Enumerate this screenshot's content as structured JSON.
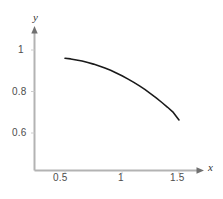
{
  "chart_data": {
    "type": "line",
    "title": "",
    "subtitle": "",
    "xlabel": "x",
    "ylabel": "y",
    "xlim": [
      0.3,
      1.62
    ],
    "ylim": [
      0.47,
      1.07
    ],
    "xticks": [
      0.5,
      1,
      1.5
    ],
    "xtick_labels": [
      "0.5",
      "1",
      "1.5"
    ],
    "yticks": [
      0.6,
      0.8,
      1
    ],
    "ytick_labels": [
      "0.6",
      "0.8",
      "1"
    ],
    "grid": false,
    "legend": false,
    "legend_position": "none",
    "axis_arrows": true,
    "series": [
      {
        "name": "curve",
        "color": "#1a1a1a",
        "x": [
          0.5,
          0.55,
          0.6,
          0.65,
          0.7,
          0.75,
          0.8,
          0.85,
          0.9,
          0.95,
          1.0,
          1.05,
          1.1,
          1.15,
          1.2,
          1.25,
          1.3,
          1.35,
          1.4,
          1.45,
          1.5
        ],
        "y": [
          0.96,
          0.957,
          0.952,
          0.947,
          0.94,
          0.932,
          0.923,
          0.913,
          0.902,
          0.889,
          0.876,
          0.861,
          0.845,
          0.828,
          0.81,
          0.79,
          0.769,
          0.747,
          0.724,
          0.699,
          0.663
        ]
      }
    ]
  },
  "axis_labels": {
    "x": "x",
    "y": "y"
  },
  "ticks": {
    "y_1": "1",
    "y_08": "0.8",
    "y_06": "0.6",
    "x_05": "0.5",
    "x_1": "1",
    "x_15": "1.5"
  },
  "colors": {
    "curve": "#1a1a1a",
    "axis": "#b3b3b3",
    "tick_text": "#4d4d4d",
    "background": "#ffffff"
  }
}
